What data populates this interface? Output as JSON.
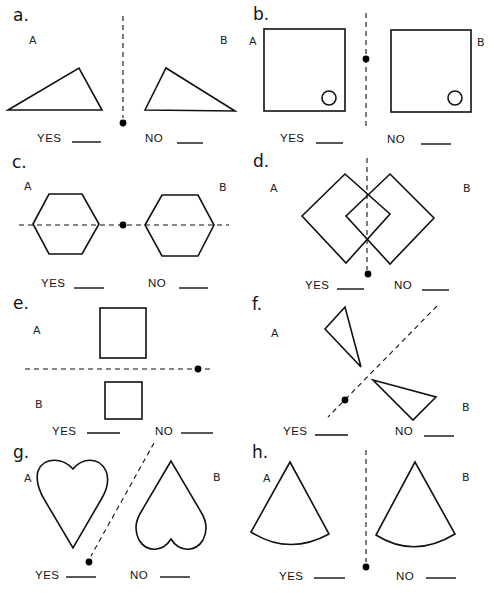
{
  "worksheet": {
    "topic": "line symmetry / reflection pairs",
    "panels": [
      {
        "id": "a",
        "label": "a.",
        "shape": "triangle",
        "figure_a": "A",
        "figure_b": "B",
        "axis": "vertical",
        "yes_label": "YES",
        "no_label": "NO"
      },
      {
        "id": "b",
        "label": "b.",
        "shape": "square with small circle",
        "figure_a": "A",
        "figure_b": "B",
        "axis": "vertical",
        "yes_label": "YES",
        "no_label": "NO"
      },
      {
        "id": "c",
        "label": "c.",
        "shape": "hexagon",
        "figure_a": "A",
        "figure_b": "B",
        "axis": "horizontal",
        "yes_label": "YES",
        "no_label": "NO"
      },
      {
        "id": "d",
        "label": "d.",
        "shape": "overlapping diamonds",
        "figure_a": "A",
        "figure_b": "B",
        "axis": "vertical",
        "yes_label": "YES",
        "no_label": "NO"
      },
      {
        "id": "e",
        "label": "e.",
        "shape": "square",
        "figure_a": "A",
        "figure_b": "B",
        "axis": "horizontal",
        "yes_label": "YES",
        "no_label": "NO"
      },
      {
        "id": "f",
        "label": "f.",
        "shape": "triangle",
        "figure_a": "A",
        "figure_b": "B",
        "axis": "diagonal",
        "yes_label": "YES",
        "no_label": "NO"
      },
      {
        "id": "g",
        "label": "g.",
        "shape": "heart",
        "figure_a": "A",
        "figure_b": "B",
        "axis": "diagonal",
        "yes_label": "YES",
        "no_label": "NO"
      },
      {
        "id": "h",
        "label": "h.",
        "shape": "circular sector",
        "figure_a": "A",
        "figure_b": "B",
        "axis": "vertical",
        "yes_label": "YES",
        "no_label": "NO"
      }
    ]
  },
  "colors": {
    "ink": "#111111",
    "background": "#ffffff"
  }
}
